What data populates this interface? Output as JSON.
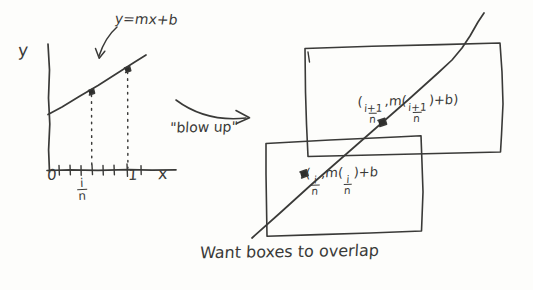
{
  "figure": {
    "kind": "hand-drawn-math-sketch",
    "ink_color": "#3a3a38",
    "paper_color": "#fdfdfb",
    "caption": "Want boxes to overlap"
  },
  "left_graph": {
    "y_axis_label": "y",
    "x_axis_label": "x",
    "origin_label": "0",
    "one_label": "1",
    "tick_fraction": {
      "numerator": "i",
      "denominator": "n"
    },
    "line_equation": "y=mx+b",
    "tick_count": 8,
    "points": [
      {
        "name": "point-i-over-n",
        "x_label": "i/n"
      },
      {
        "name": "point-i-plus-1-over-n",
        "x_label": "1"
      }
    ]
  },
  "transition": {
    "label": "\"blow up\"",
    "arrow": "curved-right-arrow"
  },
  "right_boxes": {
    "upper": {
      "name": "upper-box",
      "label_open": "(",
      "label_numerator_1": "i+1",
      "label_denominator_1": "n",
      "label_comma": ",",
      "label_m": "m",
      "label_paren_open": "(",
      "label_numerator_2": "i+1",
      "label_denominator_2": "n",
      "label_paren_close": ")",
      "label_plus_b": "+b",
      "label_close": ")"
    },
    "lower": {
      "name": "lower-box",
      "label_open": "(",
      "label_numerator_1": "i",
      "label_denominator_1": "n",
      "label_comma": ",",
      "label_m": "m",
      "label_paren_open": "(",
      "label_numerator_2": "i",
      "label_denominator_2": "n",
      "label_paren_close": ")",
      "label_plus_b": "+b"
    }
  }
}
